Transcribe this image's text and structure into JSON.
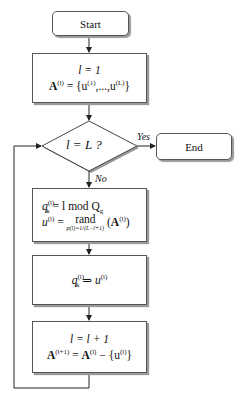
{
  "start": {
    "label": "Start"
  },
  "end": {
    "label": "End"
  },
  "init": {
    "line1": "l = 1",
    "line2_lhs": "A",
    "line2_lhs_sup": "(l)",
    "line2_rhs_pre": " = {u",
    "line2_sup1": "(1)",
    "line2_mid": ",...,u",
    "line2_sup2": "(L)",
    "line2_close": "}"
  },
  "decision": {
    "label": "l = L ?"
  },
  "edges": {
    "yes": "Yes",
    "no": "No"
  },
  "assign": {
    "q": "q",
    "q_sub": "k",
    "q_sup": "(l)",
    "q_rhs": " = l mod Q",
    "q_rhs_sub": "g",
    "u": "u",
    "u_sup": "(l)",
    "eq": " = ",
    "rand": "rand",
    "rand_under": "p(l)=1/(L−l+1)",
    "arg_open": " (",
    "arg_A": "A",
    "arg_sup": "(l)",
    "arg_close": ")"
  },
  "map": {
    "q": "q",
    "q_sub": "k",
    "q_sup": "(l)",
    "arrow": " ⇒ ",
    "u": "u",
    "u_sup": "(l)"
  },
  "update": {
    "line1": "l = l + 1",
    "A": "A",
    "A_sup": "(l+1)",
    "eq": " = ",
    "A2": "A",
    "A2_sup": "(l)",
    "minus": " − {u",
    "u_sup": "(l)",
    "close": "}"
  }
}
